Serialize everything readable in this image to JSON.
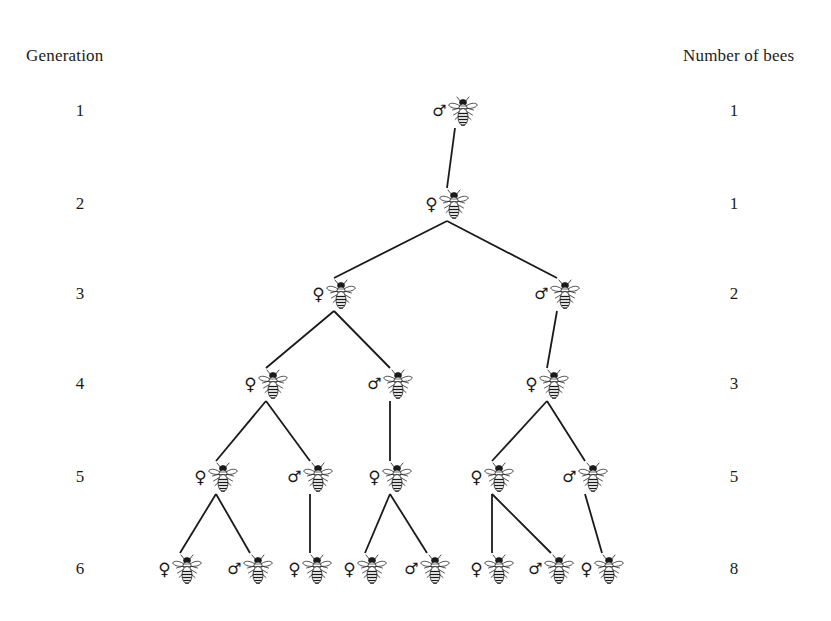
{
  "headings": {
    "left": "Generation",
    "right": "Number of bees"
  },
  "glyphs": {
    "female": "♀",
    "male": "♂"
  },
  "chart_data": {
    "type": "diagram",
    "subtype": "genealogy-tree",
    "xlabel": "",
    "ylabel": "",
    "legend": [],
    "categories": [
      "1",
      "2",
      "3",
      "4",
      "5",
      "6"
    ],
    "values": [
      1,
      1,
      2,
      3,
      5,
      8
    ],
    "series": [
      {
        "name": "Number of bees",
        "values": [
          1,
          1,
          2,
          3,
          5,
          8
        ]
      }
    ],
    "rows": [
      {
        "generation": "1",
        "count": "1",
        "y": 112,
        "bees": [
          {
            "id": "g1b1",
            "sex": "male",
            "x": 455
          }
        ]
      },
      {
        "generation": "2",
        "count": "1",
        "y": 205,
        "bees": [
          {
            "id": "g2b1",
            "sex": "female",
            "x": 447
          }
        ]
      },
      {
        "generation": "3",
        "count": "2",
        "y": 295,
        "bees": [
          {
            "id": "g3b1",
            "sex": "female",
            "x": 334
          },
          {
            "id": "g3b2",
            "sex": "male",
            "x": 557
          }
        ]
      },
      {
        "generation": "4",
        "count": "3",
        "y": 385,
        "bees": [
          {
            "id": "g4b1",
            "sex": "female",
            "x": 266
          },
          {
            "id": "g4b2",
            "sex": "male",
            "x": 390
          },
          {
            "id": "g4b3",
            "sex": "female",
            "x": 547
          }
        ]
      },
      {
        "generation": "5",
        "count": "5",
        "y": 478,
        "bees": [
          {
            "id": "g5b1",
            "sex": "female",
            "x": 216
          },
          {
            "id": "g5b2",
            "sex": "male",
            "x": 310
          },
          {
            "id": "g5b3",
            "sex": "female",
            "x": 390
          },
          {
            "id": "g5b4",
            "sex": "female",
            "x": 492
          },
          {
            "id": "g5b5",
            "sex": "male",
            "x": 585
          }
        ]
      },
      {
        "generation": "6",
        "count": "8",
        "y": 570,
        "bees": [
          {
            "id": "g6b1",
            "sex": "female",
            "x": 180
          },
          {
            "id": "g6b2",
            "sex": "male",
            "x": 250
          },
          {
            "id": "g6b3",
            "sex": "female",
            "x": 310
          },
          {
            "id": "g6b4",
            "sex": "female",
            "x": 365
          },
          {
            "id": "g6b5",
            "sex": "male",
            "x": 427
          },
          {
            "id": "g6b6",
            "sex": "female",
            "x": 492
          },
          {
            "id": "g6b7",
            "sex": "male",
            "x": 551
          },
          {
            "id": "g6b8",
            "sex": "female",
            "x": 602
          }
        ]
      }
    ],
    "edges": [
      {
        "from": "g1b1",
        "to": "g2b1"
      },
      {
        "from": "g2b1",
        "to": "g3b1"
      },
      {
        "from": "g2b1",
        "to": "g3b2"
      },
      {
        "from": "g3b1",
        "to": "g4b1"
      },
      {
        "from": "g3b1",
        "to": "g4b2"
      },
      {
        "from": "g3b2",
        "to": "g4b3"
      },
      {
        "from": "g4b1",
        "to": "g5b1"
      },
      {
        "from": "g4b1",
        "to": "g5b2"
      },
      {
        "from": "g4b2",
        "to": "g5b3"
      },
      {
        "from": "g4b3",
        "to": "g5b4"
      },
      {
        "from": "g4b3",
        "to": "g5b5"
      },
      {
        "from": "g5b1",
        "to": "g6b1"
      },
      {
        "from": "g5b1",
        "to": "g6b2"
      },
      {
        "from": "g5b2",
        "to": "g6b3"
      },
      {
        "from": "g5b3",
        "to": "g6b4"
      },
      {
        "from": "g5b3",
        "to": "g6b5"
      },
      {
        "from": "g5b4",
        "to": "g6b6"
      },
      {
        "from": "g5b4",
        "to": "g6b7"
      },
      {
        "from": "g5b5",
        "to": "g6b8"
      }
    ],
    "colors": {
      "background": "#ffffff",
      "ink": "#231f20",
      "edge": "#1a1a1a"
    }
  }
}
